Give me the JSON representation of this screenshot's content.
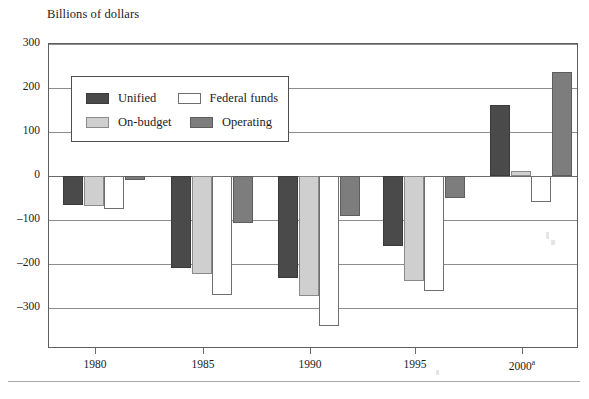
{
  "axis_title": "Billions of dollars",
  "legend": {
    "entries": [
      {
        "key": "unified",
        "label": "Unified"
      },
      {
        "key": "federalfunds",
        "label": "Federal funds"
      },
      {
        "key": "onbudget",
        "label": "On-budget"
      },
      {
        "key": "operating",
        "label": "Operating"
      }
    ]
  },
  "colors": {
    "unified": "#4a4a4a",
    "onbudget": "#cfcfcf",
    "federalfunds": "#ffffff",
    "operating": "#7d7d7d",
    "frame": "#5e5e5e",
    "grid": "#8d8d8d"
  },
  "axis": {
    "y_ticks": [
      "300",
      "200",
      "100",
      "0",
      "–100",
      "–200",
      "–300"
    ],
    "x_ticks": [
      "1980",
      "1985",
      "1990",
      "1995",
      "2000"
    ],
    "x_tick_superscripts": [
      "",
      "",
      "",
      "",
      "a"
    ]
  },
  "chart_data": {
    "type": "bar",
    "title": "",
    "xlabel": "",
    "ylabel": "Billions of dollars",
    "ylim": [
      -380,
      300
    ],
    "yticks": [
      300,
      200,
      100,
      0,
      -100,
      -200,
      -300
    ],
    "grid": true,
    "legend_position": "upper-left-inside",
    "categories": [
      "1980",
      "1985",
      "1990",
      "1995",
      "2000"
    ],
    "category_notes": {
      "2000": "a"
    },
    "series": [
      {
        "name": "Unified",
        "values": [
          -66,
          -209,
          -232,
          -159,
          161
        ]
      },
      {
        "name": "On-budget",
        "values": [
          -68,
          -223,
          -273,
          -238,
          12
        ]
      },
      {
        "name": "Federal funds",
        "values": [
          -74,
          -270,
          -341,
          -262,
          -60
        ]
      },
      {
        "name": "Operating",
        "values": [
          -8,
          -107,
          -91,
          -50,
          236
        ]
      }
    ]
  }
}
